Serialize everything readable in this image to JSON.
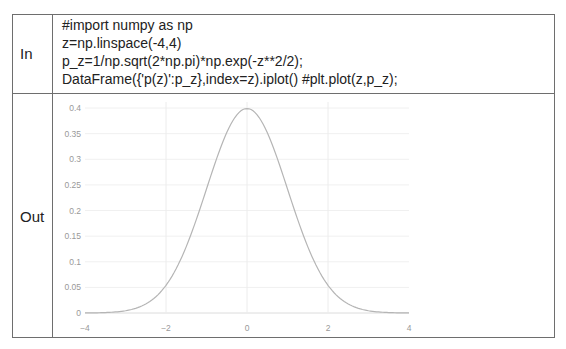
{
  "cells": {
    "in_label": "In",
    "out_label": "Out"
  },
  "code": {
    "lines": [
      "#import numpy as np",
      "z=np.linspace(-4,4)",
      "p_z=1/np.sqrt(2*np.pi)*np.exp(-z**2/2);",
      "DataFrame({'p(z)':p_z},index=z).iplot() #plt.plot(z,p_z);"
    ]
  },
  "chart_data": {
    "type": "line",
    "title": "",
    "xlabel": "",
    "ylabel": "",
    "xlim": [
      -4,
      4
    ],
    "ylim": [
      0,
      0.4
    ],
    "grid": true,
    "legend": "none",
    "x_ticks": [
      "-4",
      "-2",
      "0",
      "2",
      "4"
    ],
    "y_ticks": [
      "0",
      "0.05",
      "0.1",
      "0.15",
      "0.2",
      "0.25",
      "0.3",
      "0.35",
      "0.4"
    ],
    "series": [
      {
        "name": "p(z)",
        "color": "#b5b5b5",
        "x": [
          -4,
          -3.5,
          -3,
          -2.5,
          -2,
          -1.5,
          -1,
          -0.5,
          0,
          0.5,
          1,
          1.5,
          2,
          2.5,
          3,
          3.5,
          4
        ],
        "values": [
          0.0001,
          0.0009,
          0.0044,
          0.0175,
          0.054,
          0.1295,
          0.242,
          0.352,
          0.399,
          0.352,
          0.242,
          0.1295,
          0.054,
          0.0175,
          0.0044,
          0.0009,
          0.0001
        ]
      }
    ]
  }
}
